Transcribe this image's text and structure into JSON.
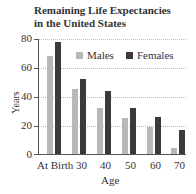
{
  "chart_data": {
    "type": "bar",
    "title": "Remaining Life Expectancies in the United States",
    "title_lines": [
      "Remaining Life Expectancies",
      "in the United States"
    ],
    "xlabel": "Age",
    "ylabel": "Years",
    "categories": [
      "At Birth",
      "30",
      "40",
      "50",
      "60",
      "70"
    ],
    "series": [
      {
        "name": "Males",
        "color": "#b8b8b8",
        "values": [
          68,
          45,
          32,
          25,
          19,
          4
        ]
      },
      {
        "name": "Females",
        "color": "#3a3a3a",
        "values": [
          78,
          52,
          44,
          32,
          26,
          17
        ]
      }
    ],
    "ylim": [
      0,
      80
    ],
    "yticks": [
      0,
      20,
      40,
      60,
      80
    ],
    "grid": true,
    "legend_position": "top-right inside"
  },
  "labels": {
    "title_line1": "Remaining Life Expectancies",
    "title_line2": "in the United States",
    "xlabel": "Age",
    "ylabel": "Years",
    "legend_males": "Males",
    "legend_females": "Females",
    "y0": "0",
    "y20": "20",
    "y40": "40",
    "y60": "60",
    "y80": "80",
    "x0": "At Birth",
    "x1": "30",
    "x2": "40",
    "x3": "50",
    "x4": "60",
    "x5": "70"
  }
}
